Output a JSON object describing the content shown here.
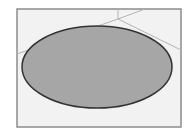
{
  "diagram": {
    "type": "ellipse-in-frame",
    "colors": {
      "background": "#ffffff",
      "frame_fill": "#f2f2f2",
      "frame_stroke": "#8c8c8c",
      "ellipse_fill": "#a6a6a6",
      "ellipse_stroke": "#333333",
      "construction_lines": "#b4b4b4"
    },
    "frame": {
      "x": 17,
      "y": 9,
      "width": 164,
      "height": 118
    },
    "ellipse": {
      "cx": 97,
      "cy": 67,
      "rx": 75,
      "ry": 41
    },
    "lines": [
      {
        "x1": 118,
        "y1": 9,
        "x2": 118,
        "y2": 19
      },
      {
        "x1": 118,
        "y1": 19,
        "x2": 17,
        "y2": 54
      },
      {
        "x1": 118,
        "y1": 19,
        "x2": 181,
        "y2": 50
      },
      {
        "x1": 118,
        "y1": 19,
        "x2": 145,
        "y2": 9
      }
    ]
  }
}
